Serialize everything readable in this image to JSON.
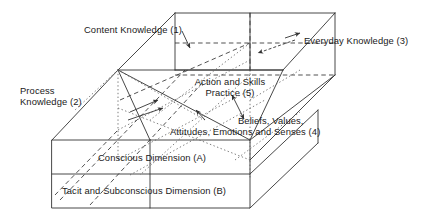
{
  "figure": {
    "type": "cuboid-model-diagram",
    "shape_name": "three-dimensional-knowledge-model-box",
    "line_color": "#333333",
    "text_color": "#1a1a1a",
    "background": "#ffffff"
  },
  "labels": {
    "content_knowledge": "Content Knowledge (1)",
    "everyday_knowledge": "Everyday Knowledge (3)",
    "process_knowledge_line1": "Process",
    "process_knowledge_line2": "Knowledge (2)",
    "action_skills_line1": "Action and Skills",
    "action_skills_line2": "Practice (5)",
    "beliefs_line1": "Beliefs, Values,",
    "beliefs_line2": "Attitudes, Emotions and Senses (4)",
    "conscious_dimension": "Conscious Dimension (A)",
    "tacit_dimension": "Tacit and Subconscious Dimension (B)"
  },
  "annotations": {
    "arrow_content_knowledge": "arrow-down-right-icon",
    "arrow_everyday_knowledge": "arrow-left-dashed-icon",
    "arrow_action_skills": "double-headed-arrow-icon",
    "arrow_process_knowledge": "arrow-right-icon",
    "arrow_beliefs": "arrow-up-left-icon"
  }
}
